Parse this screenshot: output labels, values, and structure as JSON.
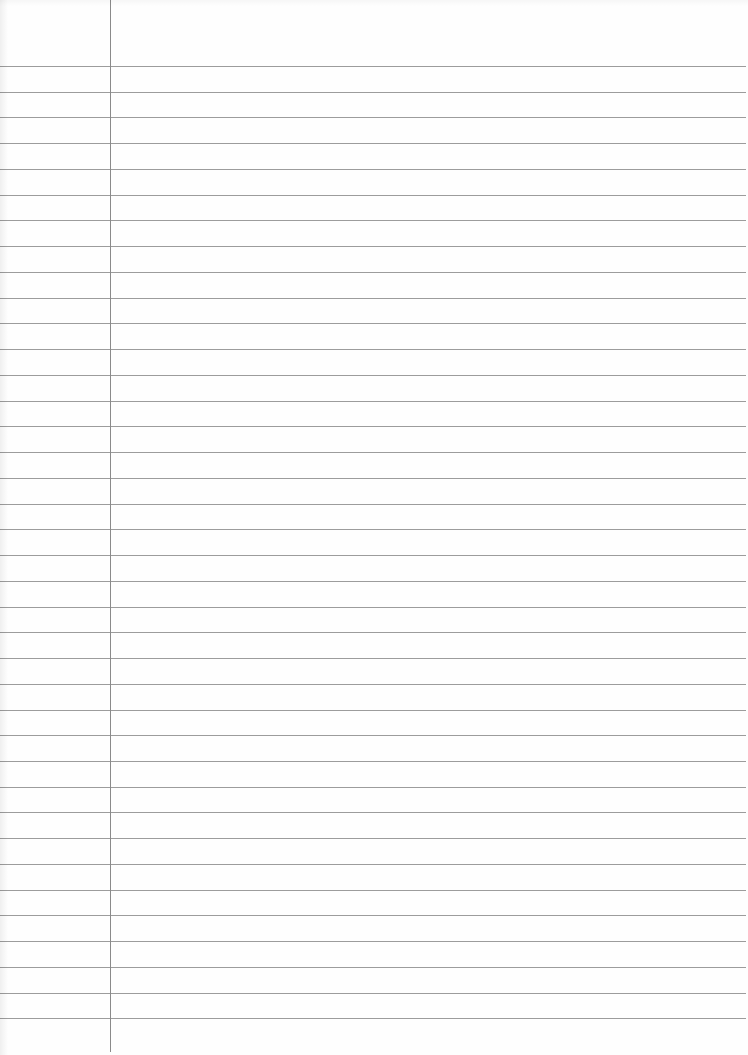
{
  "page": {
    "type": "ruled-notebook-paper",
    "background_color": "#fefefe",
    "rule_color": "#9c9c9c",
    "margin_line_color": "#8a8a8a"
  },
  "margin": {
    "x": 110,
    "top": 0,
    "bottom": 1052
  },
  "rules": {
    "count": 38,
    "first_y": 66,
    "spacing": 25.74,
    "right_extent": 746
  },
  "content": {
    "text": ""
  }
}
